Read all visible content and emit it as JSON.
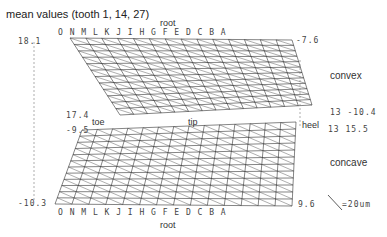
{
  "title": "mean values (tooth 1, 14, 27)",
  "chart_data": {
    "type": "surface-3d-wireframe",
    "title": "mean values (tooth 1, 14, 27)",
    "columns": [
      "O",
      "N",
      "M",
      "L",
      "K",
      "J",
      "I",
      "H",
      "G",
      "F",
      "E",
      "D",
      "C",
      "B",
      "A"
    ],
    "rows": [
      "1",
      "2",
      "3",
      "4",
      "5",
      "6",
      "7",
      "8",
      "9",
      "10",
      "11",
      "12",
      "13"
    ],
    "surfaces": [
      {
        "name": "convex",
        "corner_values": {
          "top_left": "18.1",
          "top_right": "-7.6",
          "bottom_left": "17.4",
          "bottom_right": "13 -10.4"
        }
      },
      {
        "name": "concave",
        "corner_values": {
          "top_left": "-9.5",
          "top_right": "13 15.5",
          "bottom_left": "-10.3",
          "bottom_right": "9.6"
        }
      }
    ],
    "edge_labels": {
      "top": "root",
      "bottom": "root",
      "left": "toe",
      "middle": "tip",
      "right": "heel"
    },
    "scale": "=20um"
  },
  "labels": {
    "root_top": "root",
    "root_bottom": "root",
    "toe": "toe",
    "tip": "tip",
    "heel": "heel",
    "convex": "convex",
    "concave": "concave",
    "scale": "=20um",
    "v_18_1": "18.1",
    "v_m7_6": "-7.6",
    "v_17_4": "17.4",
    "v_m10_4": "13 -10.4",
    "v_m9_5": "-9.5",
    "v_15_5": "13 15.5",
    "v_m10_3": "-10.3",
    "v_9_6": "9.6",
    "cols_top": "O N M L K J I H G F E D C B A",
    "cols_bottom": "O N M L K J I H G F E D C B A"
  }
}
